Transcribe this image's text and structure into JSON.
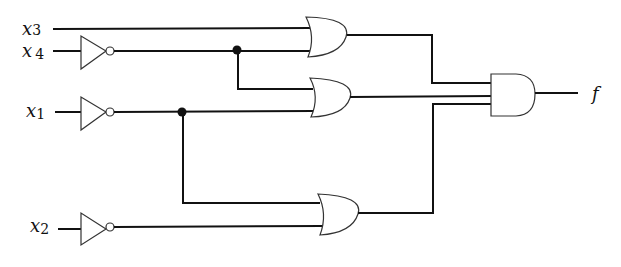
{
  "diagram": {
    "type": "logic-circuit",
    "inputs": [
      {
        "id": "x3",
        "var": "x",
        "sub": "3",
        "inverted": false
      },
      {
        "id": "x4",
        "var": "x",
        "sub": "4",
        "inverted": true
      },
      {
        "id": "x1",
        "var": "x",
        "sub": "1",
        "inverted": true
      },
      {
        "id": "x2",
        "var": "x",
        "sub": "2",
        "inverted": true
      }
    ],
    "gates": [
      {
        "id": "or1",
        "type": "OR",
        "inputs": [
          "x3",
          "not x4"
        ]
      },
      {
        "id": "or2",
        "type": "OR",
        "inputs": [
          "not x4",
          "not x1"
        ]
      },
      {
        "id": "or3",
        "type": "OR",
        "inputs": [
          "not x1",
          "not x2"
        ]
      },
      {
        "id": "and1",
        "type": "AND",
        "inputs": [
          "or1",
          "or2",
          "or3"
        ]
      }
    ],
    "output": {
      "label": "f"
    }
  }
}
